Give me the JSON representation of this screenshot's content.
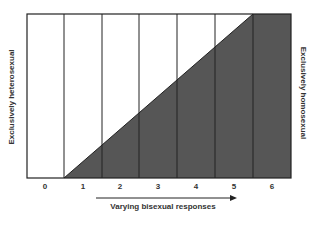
{
  "diagram": {
    "left_label": "Exclusively heterosexual",
    "right_label": "Exclusively homosexual",
    "axis_title": "Varying bisexual responses",
    "ticks": [
      "0",
      "1",
      "2",
      "3",
      "4",
      "5",
      "6"
    ],
    "colors": {
      "fill": "#565656",
      "border": "#222222",
      "background": "#ffffff"
    }
  }
}
